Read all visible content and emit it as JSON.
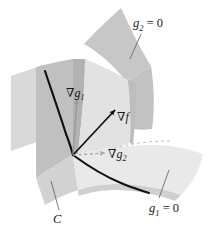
{
  "figure": {
    "background_color": "#ffffff",
    "width": 209,
    "height": 236
  },
  "labels": {
    "g2_zero": {
      "symbol": "g",
      "subscript": "2",
      "relation": "= 0",
      "text": "g2 = 0"
    },
    "g1_zero": {
      "symbol": "g",
      "subscript": "1",
      "relation": "= 0",
      "text": "g1 = 0"
    },
    "grad_g1": {
      "nabla": "∇",
      "symbol": "g",
      "subscript": "1",
      "text": "∇g1"
    },
    "grad_f": {
      "nabla": "∇",
      "symbol": "f",
      "subscript": "",
      "text": "∇f"
    },
    "grad_g2": {
      "nabla": "∇",
      "symbol": "g",
      "subscript": "2",
      "text": "∇g2"
    },
    "curve_c": {
      "symbol": "C",
      "text": "C"
    }
  },
  "colors": {
    "surface_g2_upper": "#c9c9c9",
    "surface_g1_left_light": "#d7d7d7",
    "surface_g1_left_mid": "#c2c2c2",
    "surface_vertical_panel": "#e3e3e3",
    "surface_g1_lower_right": "#e8e8e8",
    "surface_edge_strip": "#b4b4b4",
    "curve_stroke": "#101010",
    "vector_f_stroke": "#101010",
    "vector_g1_stroke": "#9a9a9a",
    "vector_g2_stroke": "#a8a8a8",
    "leader_line": "#555555",
    "text": "#1a1a1a"
  },
  "geometry": {
    "vertex_point": {
      "x": 73,
      "y": 155
    },
    "vectors": [
      {
        "name": "grad_g1",
        "from": [
          73,
          155
        ],
        "to": [
          77,
          97
        ],
        "style": "solid-gray",
        "head": "arrow"
      },
      {
        "name": "grad_f",
        "from": [
          73,
          155
        ],
        "to": [
          116,
          109
        ],
        "style": "solid-black",
        "head": "arrow"
      },
      {
        "name": "grad_g2",
        "from": [
          73,
          155
        ],
        "to": [
          106,
          153
        ],
        "style": "dashed-gray",
        "head": "arrow"
      }
    ],
    "leaders": [
      {
        "name": "leader-g2-zero",
        "from": [
          141,
          33
        ],
        "to": [
          131,
          58
        ]
      },
      {
        "name": "leader-g1-zero",
        "from": [
          159,
          198
        ],
        "to": [
          168,
          170
        ]
      },
      {
        "name": "leader-curve-c",
        "from": [
          59,
          210
        ],
        "to": [
          51,
          180
        ]
      }
    ]
  }
}
